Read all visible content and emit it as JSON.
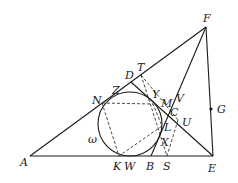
{
  "diagram": {
    "type": "geometry",
    "circle_label": "ω",
    "points": {
      "A": {
        "label": "A",
        "x": 30,
        "y": 156
      },
      "E": {
        "label": "E",
        "x": 213,
        "y": 156
      },
      "F": {
        "label": "F",
        "x": 206,
        "y": 27
      },
      "D": {
        "label": "D",
        "x": 131,
        "y": 82
      },
      "T": {
        "label": "T",
        "x": 141,
        "y": 75
      },
      "Z": {
        "label": "Z",
        "x": 117,
        "y": 92
      },
      "N": {
        "label": "N",
        "x": 102,
        "y": 103
      },
      "Y": {
        "label": "Y",
        "x": 152,
        "y": 102
      },
      "M": {
        "label": "M",
        "x": 161,
        "y": 108
      },
      "V": {
        "label": "V",
        "x": 176,
        "y": 103
      },
      "C": {
        "label": "C",
        "x": 170,
        "y": 115
      },
      "U": {
        "label": "U",
        "x": 180,
        "y": 122
      },
      "L": {
        "label": "L",
        "x": 162,
        "y": 126
      },
      "X": {
        "label": "X",
        "x": 165,
        "y": 140
      },
      "K": {
        "label": "K",
        "x": 119,
        "y": 156
      },
      "W": {
        "label": "W",
        "x": 131,
        "y": 156
      },
      "B": {
        "label": "B",
        "x": 151,
        "y": 156
      },
      "S": {
        "label": "S",
        "x": 167,
        "y": 156
      },
      "G": {
        "label": "G",
        "x": 211,
        "y": 109
      }
    },
    "circle": {
      "cx": 130,
      "cy": 124,
      "r": 32
    }
  }
}
